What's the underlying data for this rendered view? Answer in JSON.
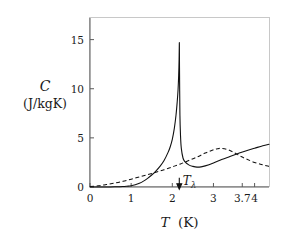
{
  "chart_data": {
    "type": "line",
    "title": "",
    "subtitle": "",
    "xlabel_symbol": "T",
    "xlabel_unit": "(K)",
    "xlabel": "T (K)",
    "ylabel_symbol": "C",
    "ylabel_unit": "(J/kgK)",
    "ylabel": "C (J/kgK)",
    "xlim": [
      0,
      4.35
    ],
    "ylim": [
      0,
      17.2
    ],
    "grid": false,
    "legend": "none",
    "xticks": [
      {
        "value": 0,
        "label": "0"
      },
      {
        "value": 1,
        "label": "1"
      },
      {
        "value": 2,
        "label": "2"
      },
      {
        "value": 3,
        "label": "3"
      },
      {
        "value": 3.7,
        "label": "3.7"
      },
      {
        "value": 4,
        "label": "4"
      }
    ],
    "yticks": [
      {
        "value": 0,
        "label": "0"
      },
      {
        "value": 5,
        "label": "5"
      },
      {
        "value": 10,
        "label": "10"
      },
      {
        "value": 15,
        "label": "15"
      }
    ],
    "annotations": [
      {
        "name": "lambda-point",
        "symbol": "T",
        "subscript": "λ",
        "text": "Tλ",
        "arrow": "down",
        "x": 2.17,
        "y": 0.95
      }
    ],
    "series": [
      {
        "name": "helium-4 specific heat",
        "style": "solid",
        "color": "#111111",
        "x": [
          0.0,
          0.2,
          0.4,
          0.6,
          0.8,
          0.9,
          1.0,
          1.1,
          1.2,
          1.3,
          1.4,
          1.5,
          1.6,
          1.7,
          1.8,
          1.9,
          1.95,
          2.0,
          2.05,
          2.09,
          2.12,
          2.14,
          2.155,
          2.165,
          2.17,
          2.172,
          2.175,
          2.185,
          2.2,
          2.22,
          2.26,
          2.3,
          2.4,
          2.5,
          2.6,
          2.7,
          2.8,
          3.0,
          3.2,
          3.4,
          3.6,
          3.8,
          4.0,
          4.2,
          4.35
        ],
        "y": [
          0.0,
          0.0,
          0.0,
          0.02,
          0.05,
          0.08,
          0.12,
          0.22,
          0.38,
          0.6,
          0.88,
          1.22,
          1.62,
          2.1,
          2.7,
          3.55,
          4.1,
          4.85,
          6.0,
          7.3,
          8.7,
          9.9,
          11.4,
          13.0,
          14.4,
          14.5,
          12.2,
          7.4,
          5.2,
          3.9,
          2.95,
          2.6,
          2.25,
          2.1,
          2.02,
          2.05,
          2.15,
          2.45,
          2.8,
          3.1,
          3.4,
          3.7,
          3.95,
          4.2,
          4.35
        ]
      },
      {
        "name": "ideal Bose gas comparison",
        "style": "dashed",
        "color": "#111111",
        "x": [
          0.0,
          0.2,
          0.4,
          0.6,
          0.8,
          1.0,
          1.2,
          1.4,
          1.6,
          1.8,
          2.0,
          2.2,
          2.4,
          2.6,
          2.8,
          3.0,
          3.1,
          3.2,
          3.35,
          3.5,
          3.65,
          3.8,
          4.0,
          4.2,
          4.35
        ],
        "y": [
          0.05,
          0.12,
          0.25,
          0.4,
          0.58,
          0.8,
          1.02,
          1.25,
          1.5,
          1.75,
          2.05,
          2.35,
          2.7,
          3.05,
          3.45,
          3.78,
          3.9,
          3.93,
          3.8,
          3.5,
          3.15,
          2.85,
          2.5,
          2.25,
          2.1
        ]
      }
    ]
  }
}
